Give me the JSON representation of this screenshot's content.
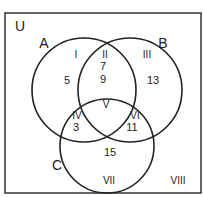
{
  "diagram": {
    "type": "venn-3-set",
    "universe_label": "U",
    "sets": [
      {
        "name": "A"
      },
      {
        "name": "B"
      },
      {
        "name": "C"
      }
    ],
    "regions": [
      {
        "id": "I",
        "label": "I",
        "value": "5"
      },
      {
        "id": "II",
        "label": "II",
        "value": "7"
      },
      {
        "id": "II_b",
        "label": "",
        "value": "9"
      },
      {
        "id": "III",
        "label": "III",
        "value": "13"
      },
      {
        "id": "IV",
        "label": "IV",
        "value": "3"
      },
      {
        "id": "V",
        "label": "V",
        "value": ""
      },
      {
        "id": "VI",
        "label": "VI",
        "value": "11"
      },
      {
        "id": "VII",
        "label": "VII",
        "value": "15"
      },
      {
        "id": "VIII",
        "label": "VIII",
        "value": ""
      }
    ],
    "colors": {
      "stroke": "#222222",
      "background": "#ffffff"
    }
  }
}
